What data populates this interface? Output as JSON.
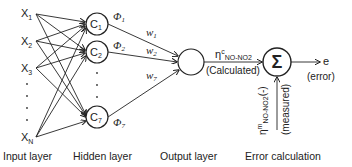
{
  "diagram": {
    "type": "neural-network",
    "layers": {
      "input": {
        "caption": "Input layer",
        "nodes": [
          {
            "name": "X",
            "sub": "1"
          },
          {
            "name": "X",
            "sub": "2"
          },
          {
            "name": "X",
            "sub": "3"
          },
          {
            "name": "X",
            "sub": "N"
          }
        ]
      },
      "hidden": {
        "caption": "Hidden layer",
        "nodes": [
          {
            "name": "C",
            "sub": "1",
            "phi": "Φ",
            "phi_sub": "1",
            "w": "w",
            "w_sub": "1"
          },
          {
            "name": "C",
            "sub": "2",
            "phi": "Φ",
            "phi_sub": "2",
            "w": "w",
            "w_sub": "2"
          },
          {
            "name": "C",
            "sub": "7",
            "phi": "Φ",
            "phi_sub": "7",
            "w": "w",
            "w_sub": "7"
          }
        ]
      },
      "output": {
        "caption": "Output layer",
        "eta": "η",
        "eta_sup": "c",
        "eta_sub": "NO-NO2",
        "note": "(Calculated)"
      },
      "error": {
        "caption": "Error calculation",
        "symbol": "Σ",
        "out_label": "e",
        "out_note": "(error)",
        "measured_eta": "η",
        "measured_sup": "m",
        "measured_sub": "NO-NO2",
        "measured_unit": "(-)",
        "measured_note": "(measured)"
      }
    },
    "ellipsis": "·"
  }
}
